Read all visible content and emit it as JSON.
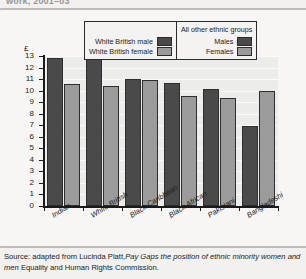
{
  "top_caption": "work, 2001–03",
  "legend": {
    "white_british": {
      "male_label": "White British male",
      "female_label": "White British female"
    },
    "other_groups": {
      "title": "All other ethnic groups",
      "male_label": "Males",
      "female_label": "Females"
    },
    "colors": {
      "male": "#4a4a4a",
      "female": "#9b9b9b"
    }
  },
  "source": {
    "prefix": "Source: adapted from Lucinda Platt,",
    "italic_title": "Pay Gaps the position of ethnic minority women and men",
    "suffix": " Equality and Human Rights Commission."
  },
  "chart_data": {
    "type": "bar",
    "title": "",
    "xlabel": "",
    "ylabel": "£",
    "ylim": [
      0,
      13
    ],
    "yticks": [
      0,
      1,
      2,
      3,
      4,
      5,
      6,
      7,
      8,
      9,
      10,
      11,
      12,
      13
    ],
    "grid": true,
    "legend_position": "top",
    "categories": [
      "Indian",
      "White British",
      "Black Caribbean",
      "Black African",
      "Pakistani",
      "Bangladeshi"
    ],
    "series": [
      {
        "name": "Males",
        "values": [
          12.8,
          12.7,
          11.0,
          10.7,
          10.1,
          6.9
        ]
      },
      {
        "name": "Females",
        "values": [
          10.6,
          10.4,
          10.9,
          9.5,
          9.4,
          10.0
        ]
      }
    ]
  }
}
